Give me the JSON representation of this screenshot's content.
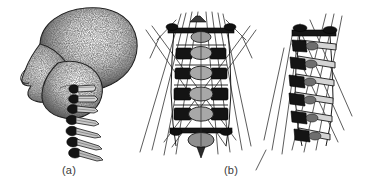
{
  "figure": {
    "kind": "anatomical-line-illustration",
    "background_color": "#ffffff",
    "ink_color": "#1a1a1a",
    "width": 372,
    "height": 187,
    "panels": [
      {
        "id": "a",
        "caption": "(a)",
        "caption_x": 62,
        "caption_y": 164,
        "description": "Stippled grayscale lateral profile of a human head facing left, with a chain of seven cervical vertebrae descending to the lower right",
        "subject": "head-with-cervical-vertebrae",
        "view": "lateral-left-facing",
        "shading": "stipple",
        "vertebra_count": 7
      },
      {
        "id": "b",
        "caption": "(b)",
        "caption_x": 224,
        "caption_y": 164,
        "description": "Two wireframe views of a cervical spine model with radiating straight muscle-vector lines",
        "subject": "cervical-spine-model-with-muscle-vectors",
        "views": [
          {
            "name": "anterior-frontal-view",
            "vertebra_count": 7,
            "symmetric": true,
            "muscle_line_count": 16
          },
          {
            "name": "oblique-lateral-view",
            "vertebra_count": 7,
            "symmetric": false,
            "muscle_line_count": 10
          }
        ]
      }
    ]
  }
}
